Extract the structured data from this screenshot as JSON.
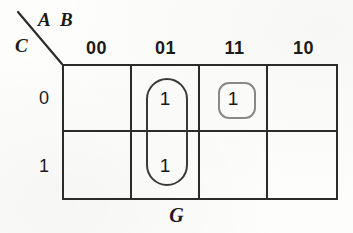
{
  "diagram": {
    "type": "karnaugh-map",
    "function_label": "G",
    "variables": {
      "columns_label_1": "A",
      "columns_label_2": "B",
      "rows_label": "C"
    },
    "column_headers": [
      "00",
      "01",
      "11",
      "10"
    ],
    "row_headers": [
      "0",
      "1"
    ],
    "cells": [
      {
        "row": "0",
        "col": "00",
        "value": ""
      },
      {
        "row": "0",
        "col": "01",
        "value": "1"
      },
      {
        "row": "0",
        "col": "11",
        "value": "1"
      },
      {
        "row": "0",
        "col": "10",
        "value": ""
      },
      {
        "row": "1",
        "col": "00",
        "value": ""
      },
      {
        "row": "1",
        "col": "01",
        "value": "1"
      },
      {
        "row": "1",
        "col": "11",
        "value": ""
      },
      {
        "row": "1",
        "col": "10",
        "value": ""
      }
    ],
    "groups": [
      {
        "name": "pair-group-01-column",
        "shape": "rounded-oval",
        "cells": [
          "0/01",
          "1/01"
        ],
        "color": "#3a3a3a"
      },
      {
        "name": "single-group-11-row0",
        "shape": "rounded-square",
        "cells": [
          "0/11"
        ],
        "color": "#8a8a8a"
      }
    ],
    "colors": {
      "grid_line": "#2b2b2b",
      "text": "#1a1a1a",
      "background": "#fdfdfc"
    }
  }
}
